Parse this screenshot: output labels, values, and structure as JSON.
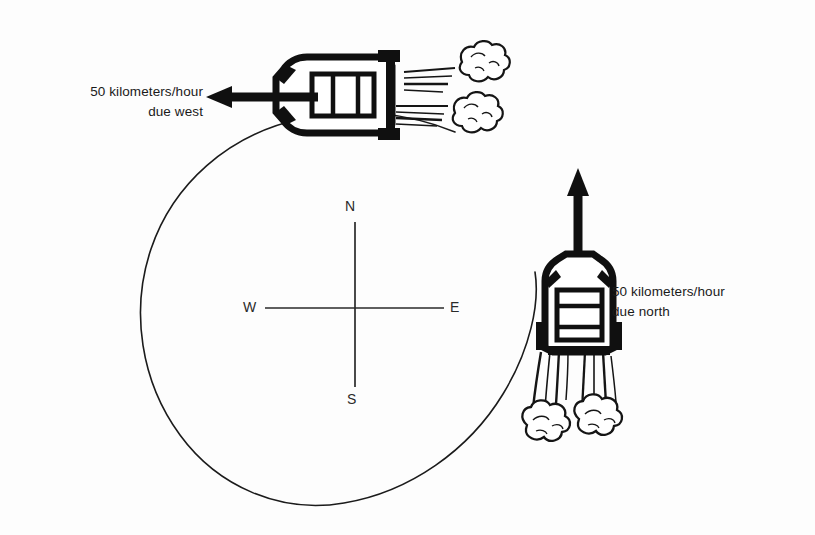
{
  "figure": {
    "background_color": "#fdfdfd",
    "ink_color": "#111111"
  },
  "labels": {
    "west_label": "50 kilometers/hour\ndue west",
    "north_label": "50 kilometers/hour\ndue north"
  },
  "compass": {
    "north": "N",
    "south": "S",
    "west": "W",
    "east": "E",
    "center_x": 355,
    "center_y": 308
  },
  "circle": {
    "center_x": 340,
    "center_y": 305,
    "radius": 198
  },
  "vectors": [
    {
      "name": "west-velocity-arrow",
      "direction": "west",
      "magnitude": "50",
      "unit": "kilometers/hour"
    },
    {
      "name": "north-velocity-arrow",
      "direction": "north",
      "magnitude": "50",
      "unit": "kilometers/hour"
    }
  ],
  "objects": [
    {
      "name": "car-top",
      "heading": "west",
      "exhaust_puffs": 2
    },
    {
      "name": "car-right",
      "heading": "north",
      "exhaust_puffs": 2
    }
  ]
}
